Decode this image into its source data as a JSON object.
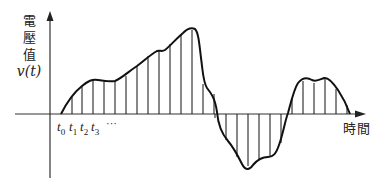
{
  "diagram": {
    "y_axis_label": {
      "lines": [
        "電",
        "壓",
        "值"
      ],
      "variable": "v(t)"
    },
    "x_axis_label": "時間",
    "time_ticks": [
      {
        "base": "t",
        "sub": "0"
      },
      {
        "base": "t",
        "sub": "1"
      },
      {
        "base": "t",
        "sub": "2"
      },
      {
        "base": "t",
        "sub": "3"
      }
    ],
    "ellipsis": "···",
    "colors": {
      "stroke": "#111111",
      "axis": "#333333",
      "background": "#ffffff"
    }
  }
}
